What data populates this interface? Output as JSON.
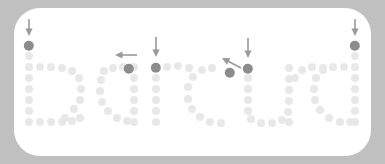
{
  "figure": {
    "title": "",
    "word": "barcud",
    "background_color": "#c0c0c0",
    "card_color": "#ffffff",
    "dot_color": "#e8e8e8",
    "highlight_color": "#8c8c8c",
    "arrow_color": "#9a9a9a",
    "dot_radius": 4.0,
    "highlight_radius": 5.2
  },
  "chart_data": {
    "type": "scatter",
    "xlabel": "",
    "ylabel": "",
    "xlim": [
      0,
      385
    ],
    "ylim": [
      0,
      164
    ],
    "grid": false,
    "legend": null,
    "series": [
      {
        "name": "stroke-dots",
        "marker": "circle",
        "color": "#e8e8e8",
        "points": [
          [
            29,
            56
          ],
          [
            29,
            67
          ],
          [
            29,
            78
          ],
          [
            29,
            89
          ],
          [
            29,
            100
          ],
          [
            29,
            111
          ],
          [
            29,
            122
          ],
          [
            40,
            67
          ],
          [
            51,
            67
          ],
          [
            62,
            68
          ],
          [
            72,
            71
          ],
          [
            79,
            78
          ],
          [
            81,
            89
          ],
          [
            80,
            100
          ],
          [
            74,
            109
          ],
          [
            65,
            118
          ],
          [
            40,
            122
          ],
          [
            51,
            122
          ],
          [
            62,
            122
          ],
          [
            72,
            121
          ],
          [
            80,
            118
          ],
          [
            104,
            71
          ],
          [
            113,
            68
          ],
          [
            123,
            67
          ],
          [
            134,
            67
          ],
          [
            134,
            78
          ],
          [
            134,
            89
          ],
          [
            134,
            100
          ],
          [
            134,
            111
          ],
          [
            134,
            122
          ],
          [
            101,
            80
          ],
          [
            100,
            91
          ],
          [
            102,
            102
          ],
          [
            108,
            111
          ],
          [
            117,
            118
          ],
          [
            127,
            121
          ],
          [
            156,
            78
          ],
          [
            156,
            89
          ],
          [
            156,
            100
          ],
          [
            156,
            111
          ],
          [
            156,
            122
          ],
          [
            167,
            67
          ],
          [
            178,
            66
          ],
          [
            189,
            68
          ],
          [
            212,
            68
          ],
          [
            202,
            70
          ],
          [
            193,
            77
          ],
          [
            188,
            87
          ],
          [
            188,
            99
          ],
          [
            192,
            109
          ],
          [
            200,
            117
          ],
          [
            210,
            122
          ],
          [
            221,
            123
          ],
          [
            248,
            78
          ],
          [
            248,
            89
          ],
          [
            248,
            100
          ],
          [
            248,
            111
          ],
          [
            251,
            119
          ],
          [
            261,
            123
          ],
          [
            272,
            123
          ],
          [
            282,
            120
          ],
          [
            288,
            112
          ],
          [
            289,
            101
          ],
          [
            289,
            90
          ],
          [
            289,
            79
          ],
          [
            289,
            68
          ],
          [
            289,
            122
          ],
          [
            323,
            68
          ],
          [
            312,
            67
          ],
          [
            302,
            70
          ],
          [
            295,
            78
          ],
          [
            355,
            56
          ],
          [
            355,
            67
          ],
          [
            355,
            78
          ],
          [
            355,
            89
          ],
          [
            355,
            100
          ],
          [
            355,
            111
          ],
          [
            355,
            122
          ],
          [
            344,
            67
          ],
          [
            333,
            67
          ],
          [
            323,
            70
          ],
          [
            316,
            78
          ],
          [
            314,
            89
          ],
          [
            315,
            100
          ],
          [
            320,
            110
          ],
          [
            329,
            118
          ],
          [
            340,
            122
          ],
          [
            350,
            122
          ]
        ]
      },
      {
        "name": "marked-start-dots",
        "marker": "circle",
        "color": "#8c8c8c",
        "points": [
          [
            29,
            46
          ],
          [
            129,
            69
          ],
          [
            156,
            68
          ],
          [
            230,
            73
          ],
          [
            248,
            69
          ],
          [
            355,
            46
          ]
        ],
        "labels": [
          "b-start",
          "a-start",
          "r-start",
          "u-inner",
          "u-start",
          "d-start"
        ]
      }
    ],
    "annotations": [
      {
        "text": "",
        "type": "arrow",
        "direction": "down",
        "tip_x": 29,
        "tip_y": 36,
        "dx": 0,
        "dy": -17
      },
      {
        "text": "",
        "type": "arrow",
        "direction": "left",
        "tip_x": 115,
        "tip_y": 55,
        "dx": 22,
        "dy": 0
      },
      {
        "text": "",
        "type": "arrow",
        "direction": "down",
        "tip_x": 156,
        "tip_y": 57,
        "dx": 0,
        "dy": -20
      },
      {
        "text": "",
        "type": "arrow",
        "direction": "up-left",
        "tip_x": 222,
        "tip_y": 58,
        "dx": 19,
        "dy": 10
      },
      {
        "text": "",
        "type": "arrow",
        "direction": "down",
        "tip_x": 248,
        "tip_y": 58,
        "dx": 0,
        "dy": -20
      },
      {
        "text": "",
        "type": "arrow",
        "direction": "down",
        "tip_x": 355,
        "tip_y": 36,
        "dx": 0,
        "dy": -17
      }
    ]
  }
}
